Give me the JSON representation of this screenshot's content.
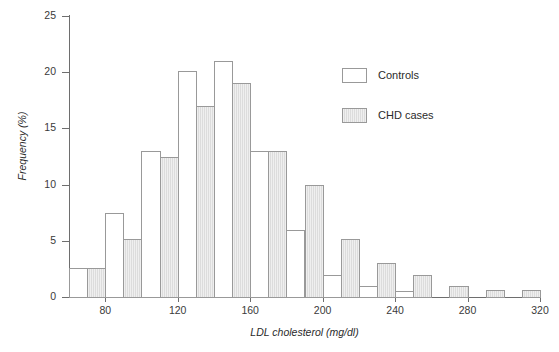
{
  "chart_data": {
    "type": "bar",
    "title": "",
    "subtitle": "",
    "xlabel": "LDL cholesterol (mg/dl)",
    "ylabel": "Frequency (%)",
    "xlim": [
      60,
      320
    ],
    "ylim": [
      0,
      25
    ],
    "grid": false,
    "legend_position": "inside-right",
    "x_tick_labels": [
      "80",
      "120",
      "160",
      "200",
      "240",
      "280",
      "320"
    ],
    "x_tick_values": [
      80,
      120,
      160,
      200,
      240,
      280,
      320
    ],
    "y_tick_labels": [
      "0",
      "5",
      "10",
      "15",
      "20",
      "25"
    ],
    "y_tick_values": [
      0,
      5,
      10,
      15,
      20,
      25
    ],
    "bin_width": 20,
    "bin_starts": [
      60,
      80,
      100,
      120,
      140,
      160,
      180,
      200,
      220,
      240,
      260,
      280,
      300
    ],
    "bin_labels": [
      "60-80",
      "80-100",
      "100-120",
      "120-140",
      "140-160",
      "160-180",
      "180-200",
      "200-220",
      "220-240",
      "240-260",
      "260-280",
      "280-300",
      "300-320"
    ],
    "series": [
      {
        "name": "Controls",
        "color": "#ffffff",
        "border_color": "#999999",
        "values": [
          2.6,
          7.5,
          13.0,
          20.1,
          21.0,
          13.0,
          6.0,
          2.0,
          1.0,
          0.5,
          0,
          0,
          0
        ]
      },
      {
        "name": "CHD cases",
        "color": "#dcdcdc",
        "border_color": "#999999",
        "values": [
          2.6,
          5.2,
          12.5,
          17.0,
          19.0,
          13.0,
          10.0,
          5.2,
          3.0,
          2.0,
          1.0,
          0.6,
          0.6
        ]
      }
    ]
  },
  "legend": {
    "items": [
      {
        "label": "Controls",
        "style": "controls"
      },
      {
        "label": "CHD cases",
        "style": "cases"
      }
    ]
  }
}
